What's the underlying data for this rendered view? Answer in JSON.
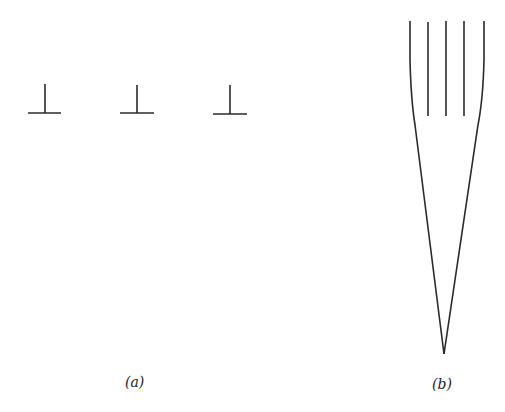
{
  "figure": {
    "panels": [
      {
        "id": "a",
        "label": "(a)",
        "description": "Three edge dislocation symbols (inverted T)",
        "symbols": [
          {
            "cx": 45,
            "top": 84,
            "base": 113,
            "half_width": 17
          },
          {
            "cx": 137,
            "top": 85,
            "base": 113,
            "half_width": 17
          },
          {
            "cx": 230,
            "top": 85,
            "base": 114,
            "half_width": 17
          }
        ]
      },
      {
        "id": "b",
        "label": "(b)",
        "description": "Five parallel lines converging into a wedge",
        "lines_x": [
          410,
          428,
          446,
          464,
          484
        ],
        "lines_top": 21,
        "inner_lines_bottom": 116,
        "apex": {
          "x": 444,
          "y": 354
        }
      }
    ],
    "stroke_color": "#2a2a2a"
  }
}
